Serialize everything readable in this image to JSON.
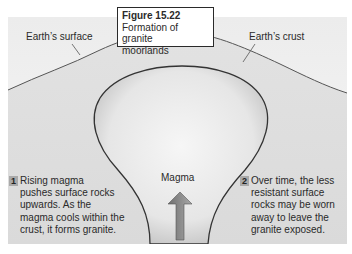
{
  "figure": {
    "number": "Figure 15.22",
    "title_line1": "Formation of granite",
    "title_line2": "moorlands"
  },
  "labels": {
    "surface": "Earth’s surface",
    "crust": "Earth’s crust",
    "magma": "Magma"
  },
  "steps": [
    {
      "badge": "1",
      "lines": [
        "Rising magma",
        "pushes surface rocks",
        "upwards. As the",
        "magma cools within the",
        "crust, it forms granite."
      ]
    },
    {
      "badge": "2",
      "lines": [
        "Over time, the less",
        "resistant surface",
        "rocks may be worn",
        "away to leave the",
        "granite exposed."
      ]
    }
  ],
  "colors": {
    "sky": "#f4f4f4",
    "crust": "#dcdcdc",
    "magma": "#e9e9e9",
    "outline": "#3a3a3a",
    "arrow": "#8a8a8a"
  }
}
